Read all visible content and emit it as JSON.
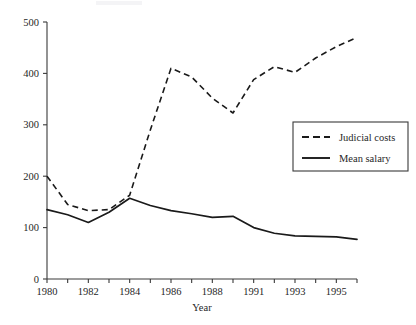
{
  "chart_data": {
    "type": "line",
    "title": "",
    "xlabel": "Year",
    "ylabel": "",
    "xlim": [
      1980,
      1995
    ],
    "ylim": [
      0,
      500
    ],
    "grid": false,
    "legend_position": "right-middle",
    "x": [
      1980,
      1981,
      1982,
      1983,
      1984,
      1985,
      1986,
      1987,
      1988,
      1989,
      1991,
      1992,
      1993,
      1994,
      1995,
      1996
    ],
    "categories": [
      "1980",
      "1981",
      "1982",
      "1983",
      "1984",
      "1985",
      "1986",
      "1987",
      "1988",
      "1989",
      "1991",
      "1992",
      "1993",
      "1994",
      "1995",
      "1996"
    ],
    "xtick_labels": [
      "1980",
      "",
      "1982",
      "",
      "1984",
      "",
      "1986",
      "",
      "1988",
      "",
      "1991",
      "",
      "1993",
      "",
      "1995",
      ""
    ],
    "xtick_labels_visible": [
      "1980",
      "1982",
      "1984",
      "1986",
      "1988",
      "1991",
      "1993",
      "1995"
    ],
    "ytick_labels": [
      "0",
      "100",
      "200",
      "300",
      "400",
      "500"
    ],
    "yticks": [
      0,
      100,
      200,
      300,
      400,
      500
    ],
    "series": [
      {
        "name": "Judicial costs",
        "style": "dashed",
        "color": "#1a1a1a",
        "values": [
          200,
          145,
          133,
          135,
          163,
          290,
          410,
          393,
          352,
          323,
          388,
          413,
          402,
          430,
          452,
          470
        ]
      },
      {
        "name": "Mean salary",
        "style": "solid",
        "color": "#1a1a1a",
        "values": [
          135,
          125,
          110,
          130,
          157,
          143,
          133,
          127,
          120,
          122,
          100,
          89,
          84,
          83,
          82,
          77
        ]
      }
    ],
    "legend": [
      {
        "label": "Judicial costs",
        "style": "dashed"
      },
      {
        "label": "Mean salary",
        "style": "solid"
      }
    ]
  }
}
